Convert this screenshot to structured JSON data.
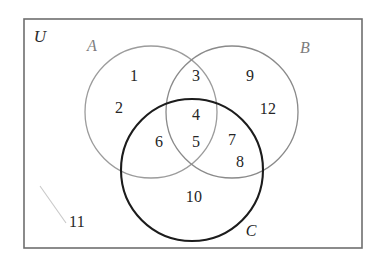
{
  "figure": {
    "kind": "venn-diagram",
    "sets_count": 3,
    "frame_color": "#6e6e6e",
    "background_color": "#ffffff"
  },
  "universe": {
    "label": "U",
    "label_x": 40,
    "label_y": 37
  },
  "sets": [
    {
      "key": "A",
      "label": "A",
      "label_x": 92,
      "label_y": 46,
      "color": "#9c9c9c",
      "stroke_width": 1.3,
      "cx": 151,
      "cy": 112,
      "r": 66
    },
    {
      "key": "B",
      "label": "B",
      "label_x": 305,
      "label_y": 48,
      "color": "#8a8a8a",
      "stroke_width": 1.3,
      "cx": 232,
      "cy": 112,
      "r": 66
    },
    {
      "key": "C",
      "label": "C",
      "label_x": 251,
      "label_y": 231,
      "color": "#1c1c1c",
      "stroke_width": 2.1,
      "cx": 192,
      "cy": 170,
      "r": 71
    }
  ],
  "elements": [
    {
      "value": "1",
      "region": "A-only",
      "x": 134,
      "y": 76
    },
    {
      "value": "2",
      "region": "A-only",
      "x": 119,
      "y": 108
    },
    {
      "value": "3",
      "region": "A-and-B",
      "x": 196,
      "y": 76
    },
    {
      "value": "4",
      "region": "A-and-B-and-C",
      "x": 196,
      "y": 115
    },
    {
      "value": "5",
      "region": "A-and-B-and-C",
      "x": 196,
      "y": 142
    },
    {
      "value": "6",
      "region": "A-and-C",
      "x": 159,
      "y": 142
    },
    {
      "value": "7",
      "region": "B-and-C",
      "x": 232,
      "y": 140
    },
    {
      "value": "8",
      "region": "B-and-C",
      "x": 240,
      "y": 162
    },
    {
      "value": "9",
      "region": "B-only",
      "x": 250,
      "y": 76
    },
    {
      "value": "12",
      "region": "B-only",
      "x": 268,
      "y": 109
    },
    {
      "value": "10",
      "region": "C-only",
      "x": 194,
      "y": 197
    },
    {
      "value": "11",
      "region": "outside-all",
      "x": 77,
      "y": 222
    }
  ],
  "artifacts": {
    "scratch_line": {
      "x1": 40,
      "y1": 186,
      "x2": 66,
      "y2": 223,
      "color": "#c9c9c9"
    }
  },
  "frame": {
    "x": 24,
    "y": 19,
    "width": 338,
    "height": 229
  }
}
